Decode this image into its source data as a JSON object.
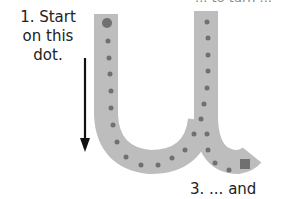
{
  "diagram": {
    "letter": "u",
    "instruction_1": "1. Start on this dot.",
    "instruction_3": "3. ... and down",
    "instruction_2_partial": "... to turn ...",
    "colors": {
      "stroke": "#bdbdbd",
      "dot": "#707070",
      "arrow": "#111111",
      "text": "#222222"
    },
    "start_marker": "large-circle",
    "end_marker": "square",
    "direction_arrow": "down"
  }
}
